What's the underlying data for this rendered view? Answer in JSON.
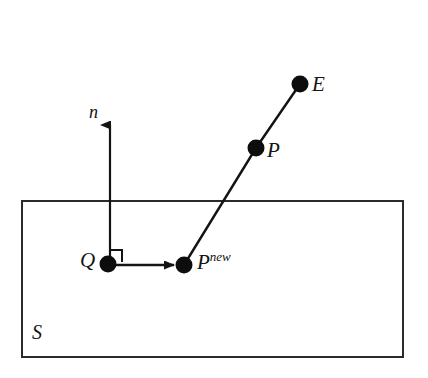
{
  "diagram": {
    "type": "geometry-sketch",
    "title": "",
    "background_color": "#ffffff",
    "stroke_color": "#141414",
    "canvas": {
      "width": 428,
      "height": 378
    },
    "surface": {
      "label": "S",
      "shape": "rectangle",
      "x": 22,
      "y": 201,
      "width": 381,
      "height": 156,
      "stroke_width": 2,
      "label_x": 38,
      "label_y": 333
    },
    "points": [
      {
        "id": "E",
        "label": "E",
        "x": 300,
        "y": 84,
        "radius": 8,
        "label_x": 318,
        "label_y": 87
      },
      {
        "id": "P",
        "label": "P",
        "x": 256,
        "y": 148,
        "radius": 8,
        "label_x": 273,
        "label_y": 153
      },
      {
        "id": "Pnew",
        "label": "P",
        "superscript": "new",
        "x": 184,
        "y": 265,
        "radius": 8,
        "label_x": 200,
        "label_y": 266
      },
      {
        "id": "Q",
        "label": "Q",
        "x": 108,
        "y": 264,
        "radius": 8,
        "label_x": 89,
        "label_y": 262
      }
    ],
    "segments": [
      {
        "id": "E-to-P",
        "from": "E",
        "to": "P",
        "x1": 300,
        "y1": 84,
        "x2": 256,
        "y2": 148
      },
      {
        "id": "P-to-Pnew",
        "from": "P",
        "to": "Pnew",
        "x1": 256,
        "y1": 148,
        "x2": 184,
        "y2": 265
      }
    ],
    "arrows": [
      {
        "id": "normal-vector",
        "label": "n",
        "from_x": 110,
        "from_y": 264,
        "to_x": 110,
        "to_y": 120,
        "label_x": 96,
        "label_y": 114
      },
      {
        "id": "q-to-pnew-arrow",
        "label": "",
        "from_x": 113,
        "from_y": 265,
        "to_x": 176,
        "to_y": 265,
        "label_x": 0,
        "label_y": 0
      }
    ],
    "right_angle_marker": {
      "id": "right-angle-at-Q",
      "x": 110,
      "y": 250,
      "size": 12
    }
  }
}
